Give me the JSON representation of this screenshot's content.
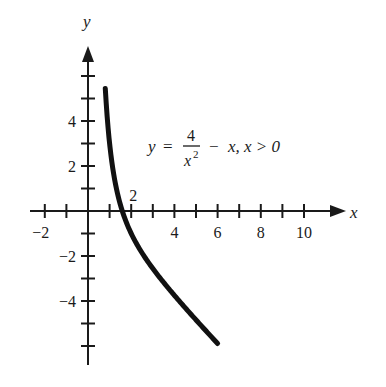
{
  "chart_data": {
    "type": "line",
    "title": "",
    "equation": "y = 4/x^2 - x, x > 0",
    "equation_parts": {
      "lhs": "y",
      "eq": "=",
      "numerator": "4",
      "denominator": "x",
      "exponent": "2",
      "rest": "−  x, x > 0"
    },
    "xlabel": "x",
    "ylabel": "y",
    "xlim": [
      -2.6,
      11.8
    ],
    "ylim": [
      -6.9,
      7.2
    ],
    "grid": false,
    "legend": null,
    "x_ticks": [
      -2,
      -1,
      0,
      1,
      2,
      3,
      4,
      5,
      6,
      7,
      8,
      9,
      10
    ],
    "x_tick_labels": [
      {
        "value": -2,
        "label": "−2"
      },
      {
        "value": 2,
        "label": "2",
        "position": "above"
      },
      {
        "value": 4,
        "label": "4"
      },
      {
        "value": 6,
        "label": "6"
      },
      {
        "value": 8,
        "label": "8"
      },
      {
        "value": 10,
        "label": "10"
      }
    ],
    "y_ticks": [
      -6,
      -5,
      -4,
      -3,
      -2,
      -1,
      1,
      2,
      3,
      4,
      5,
      6
    ],
    "y_tick_labels": [
      {
        "value": 4,
        "label": "4"
      },
      {
        "value": 2,
        "label": "2"
      },
      {
        "value": -2,
        "label": "−2"
      },
      {
        "value": -4,
        "label": "−4"
      }
    ],
    "series": [
      {
        "name": "y = 4/x^2 - x",
        "x_range": [
          0.8,
          6.0
        ],
        "x": [
          0.8,
          0.9,
          1.0,
          1.2,
          1.4,
          1.6,
          2.0,
          2.5,
          3.0,
          3.5,
          4.0,
          4.5,
          5.0,
          5.5,
          6.0
        ],
        "y": [
          5.45,
          4.04,
          3.0,
          1.58,
          0.64,
          -0.04,
          -1.0,
          -1.86,
          -2.56,
          -3.17,
          -3.75,
          -4.3,
          -4.84,
          -5.37,
          -5.89
        ]
      }
    ]
  }
}
